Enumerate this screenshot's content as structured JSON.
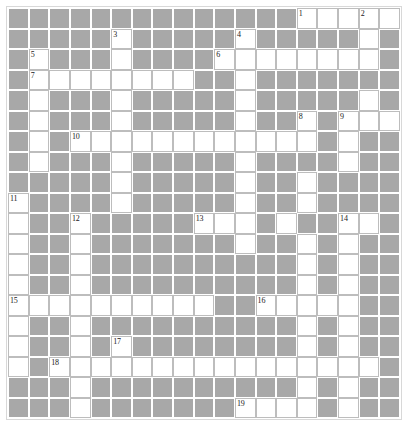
{
  "puzzle": {
    "title": "Crossword Grid",
    "type": "crossword",
    "columns": 19,
    "rows": 20,
    "colors": {
      "block_fill": "#a8a8a8",
      "open_fill": "#ffffff",
      "open_border": "#bdbdbd",
      "frame_border": "#d8d8d8",
      "number_color": "#1a1a1a"
    },
    "legend": {
      "open_cell": "white-answer-cell",
      "block_cell": "grey-block-cell"
    },
    "clue_numbers": [
      {
        "number": "1",
        "row": 1,
        "col": 15
      },
      {
        "number": "2",
        "row": 1,
        "col": 18
      },
      {
        "number": "3",
        "row": 2,
        "col": 6
      },
      {
        "number": "4",
        "row": 2,
        "col": 12
      },
      {
        "number": "5",
        "row": 3,
        "col": 2
      },
      {
        "number": "6",
        "row": 3,
        "col": 11
      },
      {
        "number": "7",
        "row": 4,
        "col": 2
      },
      {
        "number": "8",
        "row": 6,
        "col": 15
      },
      {
        "number": "9",
        "row": 6,
        "col": 17
      },
      {
        "number": "10",
        "row": 7,
        "col": 4
      },
      {
        "number": "11",
        "row": 10,
        "col": 1
      },
      {
        "number": "12",
        "row": 11,
        "col": 4
      },
      {
        "number": "13",
        "row": 11,
        "col": 10
      },
      {
        "number": "14",
        "row": 11,
        "col": 17
      },
      {
        "number": "15",
        "row": 15,
        "col": 1
      },
      {
        "number": "16",
        "row": 15,
        "col": 13
      },
      {
        "number": "17",
        "row": 17,
        "col": 6
      },
      {
        "number": "18",
        "row": 18,
        "col": 3
      },
      {
        "number": "19",
        "row": 20,
        "col": 12
      }
    ],
    "open_cells": [
      {
        "row": 1,
        "cols": [
          15,
          16,
          17,
          18,
          19
        ]
      },
      {
        "row": 2,
        "cols": [
          6,
          12,
          18
        ]
      },
      {
        "row": 3,
        "cols": [
          2,
          6,
          11,
          12,
          13,
          14,
          15,
          16,
          17,
          18
        ]
      },
      {
        "row": 4,
        "cols": [
          2,
          3,
          4,
          5,
          6,
          7,
          8,
          9,
          12
        ]
      },
      {
        "row": 5,
        "cols": [
          2,
          6,
          12,
          18
        ]
      },
      {
        "row": 6,
        "cols": [
          2,
          6,
          12,
          15,
          17,
          18,
          19
        ]
      },
      {
        "row": 7,
        "cols": [
          2,
          4,
          5,
          6,
          7,
          8,
          9,
          10,
          11,
          12,
          13,
          14,
          15,
          17
        ]
      },
      {
        "row": 8,
        "cols": [
          2,
          6,
          12,
          17
        ]
      },
      {
        "row": 9,
        "cols": [
          6,
          12,
          15
        ]
      },
      {
        "row": 10,
        "cols": [
          1,
          6,
          12,
          15
        ]
      },
      {
        "row": 11,
        "cols": [
          1,
          4,
          10,
          11,
          12,
          14,
          17,
          18
        ]
      },
      {
        "row": 12,
        "cols": [
          1,
          4,
          12,
          15,
          17
        ]
      },
      {
        "row": 13,
        "cols": [
          1,
          4,
          15,
          17
        ]
      },
      {
        "row": 14,
        "cols": [
          1,
          4,
          15,
          17
        ]
      },
      {
        "row": 15,
        "cols": [
          1,
          2,
          3,
          4,
          5,
          6,
          7,
          8,
          9,
          10,
          13,
          14,
          15,
          16,
          17
        ]
      },
      {
        "row": 16,
        "cols": [
          1,
          4,
          15,
          17
        ]
      },
      {
        "row": 17,
        "cols": [
          1,
          4,
          6,
          15,
          17
        ]
      },
      {
        "row": 18,
        "cols": [
          1,
          3,
          4,
          5,
          6,
          7,
          8,
          9,
          10,
          11,
          12,
          13,
          14,
          15,
          16,
          17,
          18
        ]
      },
      {
        "row": 19,
        "cols": [
          4,
          15,
          17
        ]
      },
      {
        "row": 20,
        "cols": [
          4,
          12,
          13,
          14,
          15,
          17
        ]
      }
    ]
  }
}
